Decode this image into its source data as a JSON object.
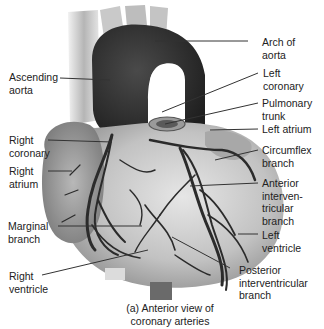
{
  "figure": {
    "caption_line1": "(a) Anterior view of",
    "caption_line2": "coronary arteries"
  },
  "labels": {
    "arch_of_aorta": {
      "l1": "Arch of",
      "l2": "aorta"
    },
    "ascending_aorta": {
      "l1": "Ascending",
      "l2": "aorta"
    },
    "left_coronary": {
      "l1": "Left",
      "l2": "coronary"
    },
    "pulmonary_trunk": {
      "l1": "Pulmonary",
      "l2": "trunk"
    },
    "left_atrium": {
      "l1": "Left atrium"
    },
    "right_coronary": {
      "l1": "Right",
      "l2": "coronary"
    },
    "right_atrium": {
      "l1": "Right",
      "l2": "atrium"
    },
    "circumflex_branch": {
      "l1": "Circumflex",
      "l2": "branch"
    },
    "anterior_interventricular_branch": {
      "l1": "Anterior",
      "l2": "interven-",
      "l3": "tricular",
      "l4": "branch"
    },
    "marginal_branch": {
      "l1": "Marginal",
      "l2": "branch"
    },
    "left_ventricle": {
      "l1": "Left",
      "l2": "ventricle"
    },
    "right_ventricle": {
      "l1": "Right",
      "l2": "ventricle"
    },
    "posterior_interventricular_branch": {
      "l1": "Posterior",
      "l2": "interventricular",
      "l3": "branch"
    }
  },
  "colors": {
    "vessel_dark": "#2b2b2b",
    "heart_fill": "#c8c8c8",
    "leader_line": "#333333"
  }
}
